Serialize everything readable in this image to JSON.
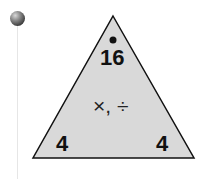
{
  "fact_triangle": {
    "top": "16",
    "bottom_left": "4",
    "bottom_right": "4",
    "operations": "×, ÷",
    "fill_color": "#d9d9d9",
    "stroke_color": "#111111"
  }
}
